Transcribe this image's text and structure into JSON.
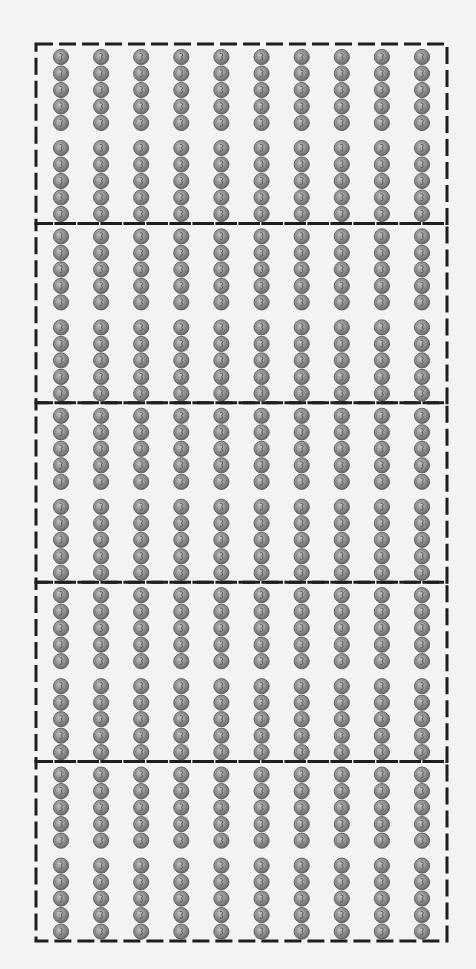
{
  "figure": {
    "groups": 5,
    "columns_per_group": 10,
    "coins_per_column": 10,
    "coins_per_subgroup": 5,
    "coins_per_group": 100,
    "total_coins": 500,
    "coin_icon": "silver-coin-icon",
    "colors": {
      "background": "#f3f3f2",
      "border": "#1e1e1e",
      "coin_fill": "#8e8e8e",
      "coin_rim": "#5c5c5c",
      "coin_highlight": "#b9b9b9",
      "coin_detail": "#4a4a4a"
    }
  }
}
